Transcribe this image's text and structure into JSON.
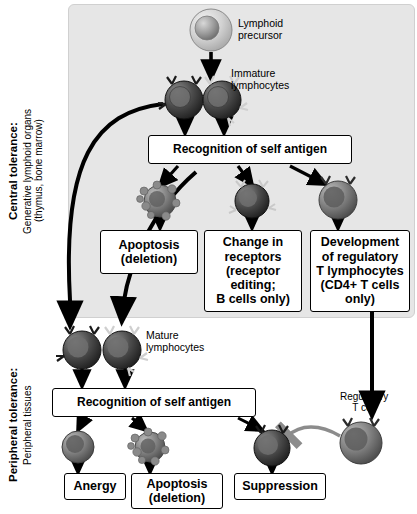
{
  "sections": {
    "central": {
      "heading": "Central tolerance:",
      "sub1": "Generative lymphoid organs",
      "sub2": "(thymus, bone marrow)"
    },
    "peripheral": {
      "heading": "Peripheral tolerance:",
      "sub1": "Peripheral tissues"
    }
  },
  "labels": {
    "lymphoid_precursor": "Lymphoid\nprecursor",
    "immature_lymphocytes": "Immature\nlymphocytes",
    "mature_lymphocytes": "Mature\nlymphocytes",
    "regulatory_t_cell": "Regulatory\nT cell"
  },
  "boxes": {
    "recognition_central": "Recognition of self antigen",
    "recognition_peripheral": "Recognition of self antigen",
    "apoptosis_central": "Apoptosis\n(deletion)",
    "change_receptors": "Change in\nreceptors\n(receptor\nediting;\nB cells only)",
    "development_treg": "Development\nof regulatory\nT lymphocytes\n(CD4+ T cells\nonly)",
    "anergy": "Anergy",
    "apoptosis_peripheral": "Apoptosis\n(deletion)",
    "suppression": "Suppression"
  },
  "colors": {
    "band": "#e6e6e6",
    "box_border": "#000000",
    "arrow": "#000000",
    "inhibit_arrow": "#808080",
    "cell_dark": "#3a3a3a",
    "cell_mid": "#7a7a7a",
    "cell_light": "#cfcfcf"
  }
}
